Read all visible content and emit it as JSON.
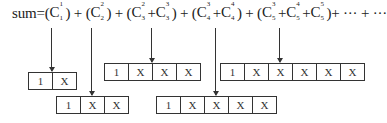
{
  "formula": {
    "prefix": "sum=",
    "groups": [
      {
        "open": "(",
        "terms": [
          {
            "c": "C",
            "sup": "1",
            "sub": "1"
          }
        ],
        "close": ")",
        "sep": " + "
      },
      {
        "open": "(",
        "terms": [
          {
            "c": "C",
            "sup": "2",
            "sub": "2"
          }
        ],
        "close": ")",
        "sep": " + "
      },
      {
        "open": "(",
        "terms": [
          {
            "c": "C",
            "sup": "2",
            "sub": "3"
          },
          {
            "c": "C",
            "sup": "3",
            "sub": "3"
          }
        ],
        "close": ")",
        "sep": " + "
      },
      {
        "open": "(",
        "terms": [
          {
            "c": "C",
            "sup": "3",
            "sub": "4"
          },
          {
            "c": "C",
            "sup": "4",
            "sub": "4"
          }
        ],
        "close": ")",
        "sep": " + "
      },
      {
        "open": "(",
        "terms": [
          {
            "c": "C",
            "sup": "3",
            "sub": "5"
          },
          {
            "c": "C",
            "sup": "4",
            "sub": "5"
          },
          {
            "c": "C",
            "sup": "5",
            "sub": "5"
          }
        ],
        "close": ")",
        "sep": "+ ··· + ···"
      }
    ],
    "plus": "+"
  },
  "boxes": [
    {
      "cells": [
        "1",
        "X"
      ]
    },
    {
      "cells": [
        "1",
        "X",
        "X"
      ]
    },
    {
      "cells": [
        "1",
        "X",
        "X",
        "X"
      ]
    },
    {
      "cells": [
        "1",
        "X",
        "X",
        "X",
        "X"
      ]
    },
    {
      "cells": [
        "1",
        "X",
        "X",
        "X",
        "X",
        "X"
      ]
    }
  ],
  "colors": {
    "line": "#333333",
    "text": "#222222",
    "background": "#ffffff"
  }
}
